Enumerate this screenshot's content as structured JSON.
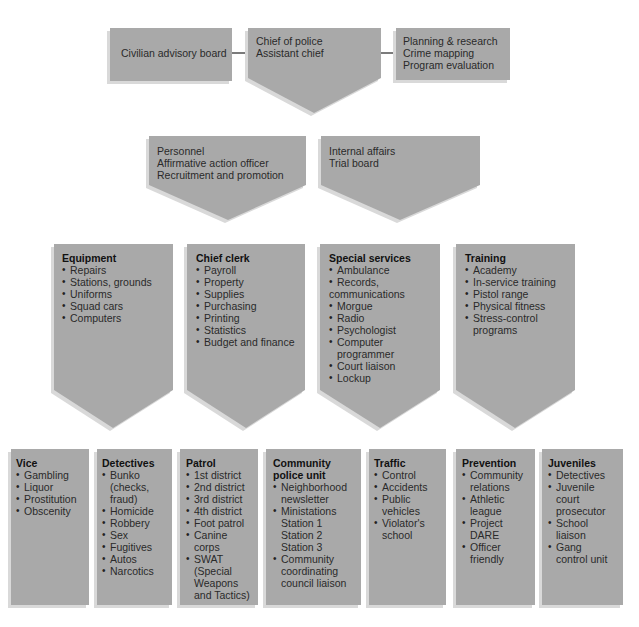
{
  "colors": {
    "box_fill": "#a9a9a9",
    "shadow": "#d9d9d9",
    "connector": "#222222",
    "text": "#2a2a2a"
  },
  "top": {
    "left": {
      "lines": [
        "Civilian advisory board"
      ]
    },
    "center": {
      "lines": [
        "Chief of police",
        "Assistant chief"
      ]
    },
    "right": {
      "lines": [
        "Planning & research",
        "Crime mapping",
        "Program evaluation"
      ]
    }
  },
  "second": {
    "left": {
      "lines": [
        "Personnel",
        "Affirmative action officer",
        "Recruitment and promotion"
      ]
    },
    "right": {
      "lines": [
        "Internal affairs",
        "Trial board"
      ]
    }
  },
  "third": [
    {
      "title": "Equipment",
      "items": [
        "Repairs",
        "Stations, grounds",
        "Uniforms",
        "Squad cars",
        "Computers"
      ]
    },
    {
      "title": "Chief clerk",
      "items": [
        "Payroll",
        "Property",
        "Supplies",
        "Purchasing",
        "Printing",
        "Statistics",
        "Budget and finance"
      ]
    },
    {
      "title": "Special services",
      "items": [
        "Ambulance",
        "Records,",
        "communications",
        "Morgue",
        "Radio",
        "Psychologist",
        "Computer",
        "programmer",
        "Court liaison",
        "Lockup"
      ]
    },
    {
      "title": "Training",
      "items": [
        "Academy",
        "In-service training",
        "Pistol range",
        "Physical fitness",
        "Stress-control",
        "programs"
      ]
    }
  ],
  "bottom": [
    {
      "title": "Vice",
      "items": [
        "Gambling",
        "Liquor",
        "Prostitution",
        "Obscenity"
      ]
    },
    {
      "title": "Detectives",
      "items": [
        "Bunko",
        "(checks,",
        "fraud)",
        "Homicide",
        "Robbery",
        "Sex",
        "Fugitives",
        "Autos",
        "Narcotics"
      ]
    },
    {
      "title": "Patrol",
      "items": [
        "1st district",
        "2nd district",
        "3rd district",
        "4th district",
        "Foot patrol",
        "Canine",
        "corps",
        "SWAT",
        "(Special",
        "Weapons",
        "and Tactics)"
      ]
    },
    {
      "title": "Community",
      "title2": "police unit",
      "items": [
        "Neighborhood",
        "newsletter",
        "Ministations",
        "Station 1",
        "Station 2",
        "Station 3",
        "Community",
        "coordinating",
        "council liaison"
      ]
    },
    {
      "title": "Traffic",
      "items": [
        "Control",
        "Accidents",
        "Public",
        "vehicles",
        "Violator's",
        "school"
      ]
    },
    {
      "title": "Prevention",
      "items": [
        "Community",
        "relations",
        "Athletic",
        "league",
        "Project",
        "DARE",
        "Officer",
        "friendly"
      ]
    },
    {
      "title": "Juveniles",
      "items": [
        "Detectives",
        "Juvenile",
        "court",
        "prosecutor",
        "School",
        "liaison",
        "Gang",
        "control unit"
      ]
    }
  ]
}
